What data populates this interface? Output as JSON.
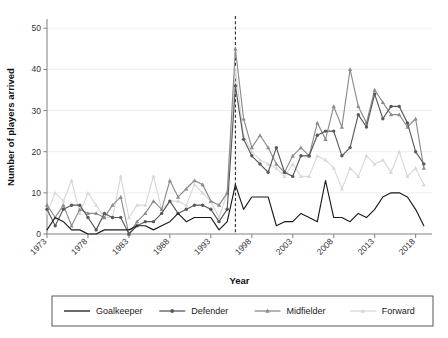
{
  "chart_data": {
    "type": "line",
    "title": "",
    "xlabel": "Year",
    "ylabel": "Number of players arrived",
    "xlim": [
      1973,
      2020
    ],
    "ylim": [
      0,
      52
    ],
    "yticks": [
      0,
      10,
      20,
      30,
      40,
      50
    ],
    "xticks": [
      1973,
      1978,
      1983,
      1988,
      1993,
      1998,
      2003,
      2008,
      2013,
      2018
    ],
    "grid": true,
    "legend_position": "bottom",
    "annotations": [
      {
        "name": "bosman-ruling-line",
        "type": "vline",
        "x": 1996,
        "style": "dashed"
      }
    ],
    "x": [
      1973,
      1974,
      1975,
      1976,
      1977,
      1978,
      1979,
      1980,
      1981,
      1982,
      1983,
      1984,
      1985,
      1986,
      1987,
      1988,
      1989,
      1990,
      1991,
      1992,
      1993,
      1994,
      1995,
      1996,
      1997,
      1998,
      1999,
      2000,
      2001,
      2002,
      2003,
      2004,
      2005,
      2006,
      2007,
      2008,
      2009,
      2010,
      2011,
      2012,
      2013,
      2014,
      2015,
      2016,
      2017,
      2018,
      2019
    ],
    "series": [
      {
        "name": "Goalkeeper",
        "color": "#1a1a1a",
        "marker": "none",
        "values": [
          1,
          4,
          3,
          1,
          1,
          0,
          0,
          1,
          1,
          1,
          1,
          2,
          2,
          1,
          2,
          3,
          5,
          3,
          4,
          4,
          4,
          1,
          3,
          12,
          6,
          9,
          9,
          9,
          2,
          3,
          3,
          5,
          4,
          3,
          13,
          4,
          4,
          3,
          5,
          4,
          6,
          9,
          10,
          10,
          9,
          6,
          2
        ]
      },
      {
        "name": "Defender",
        "color": "#595959",
        "marker": "circle",
        "values": [
          6,
          2,
          6,
          7,
          7,
          4,
          1,
          5,
          4,
          4,
          0,
          2,
          3,
          3,
          5,
          8,
          5,
          6,
          7,
          7,
          6,
          3,
          6,
          36,
          23,
          19,
          17,
          15,
          21,
          15,
          14,
          19,
          19,
          24,
          25,
          25,
          19,
          21,
          29,
          26,
          34,
          28,
          31,
          31,
          27,
          20,
          17
        ]
      },
      {
        "name": "Midfielder",
        "color": "#8c8c8c",
        "marker": "triangle",
        "values": [
          7,
          4,
          7,
          2,
          6,
          5,
          5,
          4,
          7,
          9,
          0,
          3,
          5,
          8,
          6,
          13,
          9,
          11,
          13,
          12,
          8,
          7,
          10,
          45,
          28,
          21,
          24,
          21,
          17,
          15,
          19,
          21,
          19,
          27,
          23,
          31,
          26,
          40,
          31,
          27,
          35,
          32,
          29,
          29,
          26,
          28,
          16
        ]
      },
      {
        "name": "Forward",
        "color": "#d8d8d8",
        "marker": "triangle",
        "values": [
          5,
          10,
          8,
          13,
          5,
          10,
          7,
          4,
          4,
          14,
          4,
          7,
          7,
          14,
          6,
          8,
          8,
          7,
          12,
          10,
          8,
          4,
          10,
          40,
          24,
          20,
          18,
          17,
          16,
          14,
          17,
          14,
          14,
          19,
          18,
          16,
          11,
          16,
          14,
          19,
          17,
          18,
          15,
          20,
          14,
          16,
          12
        ]
      }
    ]
  },
  "legend": {
    "items": [
      {
        "label": "Goalkeeper"
      },
      {
        "label": "Defender"
      },
      {
        "label": "Midfielder"
      },
      {
        "label": "Forward"
      }
    ]
  }
}
